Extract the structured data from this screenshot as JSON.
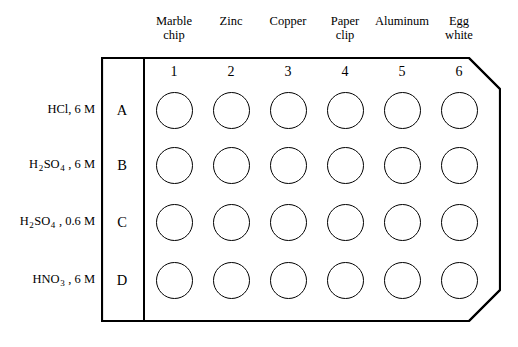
{
  "figure": {
    "line_color": "#000000",
    "background_color": "#ffffff"
  },
  "columns": [
    {
      "number": "1",
      "header": "Marble\nchip"
    },
    {
      "number": "2",
      "header": "Zinc"
    },
    {
      "number": "3",
      "header": "Copper"
    },
    {
      "number": "4",
      "header": "Paper\nclip"
    },
    {
      "number": "5",
      "header": "Aluminum"
    },
    {
      "number": "6",
      "header": "Egg\nwhite"
    }
  ],
  "rows": [
    {
      "letter": "A",
      "label_parts": [
        {
          "text": "HCl"
        },
        {
          "text": ", 6 M"
        }
      ]
    },
    {
      "letter": "B",
      "label_parts": [
        {
          "text": "H"
        },
        {
          "text": "2",
          "sub": true
        },
        {
          "text": "SO"
        },
        {
          "text": "4",
          "sub": true
        },
        {
          "text": " , 6 M"
        }
      ]
    },
    {
      "letter": "C",
      "label_parts": [
        {
          "text": "H"
        },
        {
          "text": "2",
          "sub": true
        },
        {
          "text": "SO"
        },
        {
          "text": "4",
          "sub": true
        },
        {
          "text": " , 0.6 M"
        }
      ]
    },
    {
      "letter": "D",
      "label_parts": [
        {
          "text": "HNO"
        },
        {
          "text": "3",
          "sub": true
        },
        {
          "text": " , 6 M"
        }
      ]
    }
  ],
  "wells": {
    "state": "empty",
    "count": 24
  },
  "layout": {
    "plate": {
      "left": 101,
      "top": 57,
      "width": 400,
      "height": 265
    },
    "bevel": 32,
    "divider_x": 42,
    "col_centers": [
      73,
      130,
      187,
      244,
      301,
      358
    ],
    "row_centers": [
      53,
      108,
      165,
      223
    ],
    "col_header_centers": [
      174,
      231,
      288,
      345,
      402,
      459
    ],
    "well_diameter": 37
  }
}
